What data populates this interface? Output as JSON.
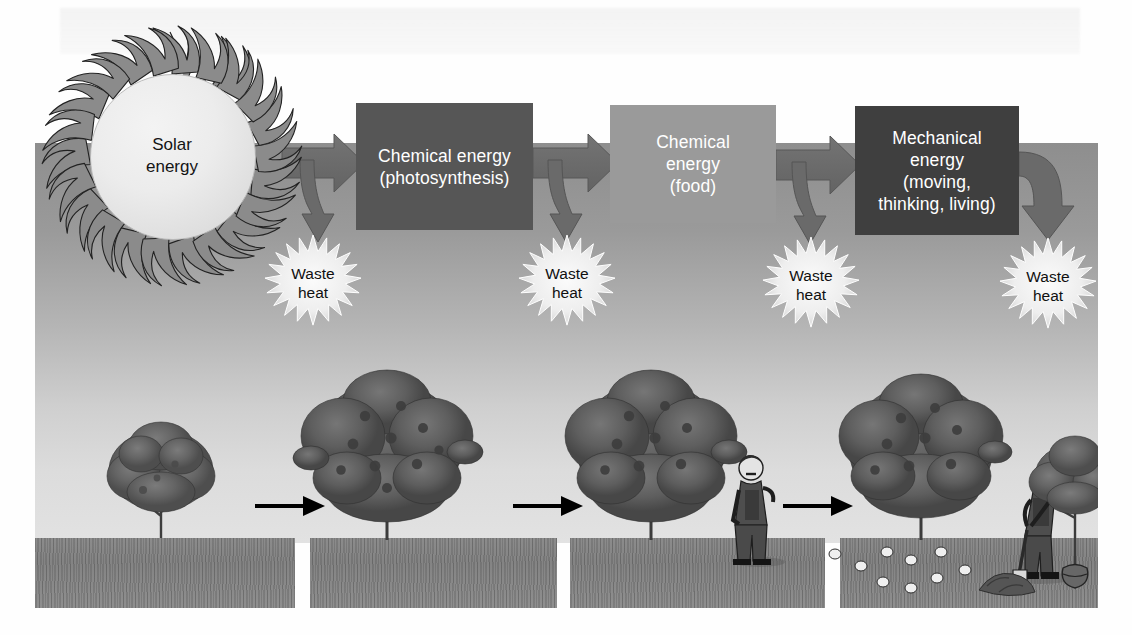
{
  "figure": {
    "title": "Energy flow from solar energy to mechanical energy with waste heat at each step",
    "type": "process-flow-diagram"
  },
  "sun": {
    "label_line1": "Solar",
    "label_line2": "energy",
    "icon": "sun-icon"
  },
  "energy_boxes": [
    {
      "id": "photosynthesis",
      "lines": [
        "Chemical energy",
        "(photosynthesis)"
      ],
      "color": "#565656",
      "text_color": "#ffffff"
    },
    {
      "id": "food",
      "lines": [
        "Chemical",
        "energy",
        "(food)"
      ],
      "color": "#9a9a9a",
      "text_color": "#ffffff"
    },
    {
      "id": "mechanical",
      "lines": [
        "Mechanical",
        "energy",
        "(moving,",
        "thinking, living)"
      ],
      "color": "#3f3f3f",
      "text_color": "#ffffff"
    }
  ],
  "waste_heat": [
    {
      "line1": "Waste",
      "line2": "heat"
    },
    {
      "line1": "Waste",
      "line2": "heat"
    },
    {
      "line1": "Waste",
      "line2": "heat"
    },
    {
      "line1": "Waste",
      "line2": "heat"
    }
  ],
  "scene_panels": [
    {
      "id": "panel-1",
      "contents": [
        "small-tree"
      ]
    },
    {
      "id": "panel-2",
      "contents": [
        "large-fruit-tree"
      ]
    },
    {
      "id": "panel-3",
      "contents": [
        "large-fruit-tree",
        "standing-man"
      ]
    },
    {
      "id": "panel-4",
      "contents": [
        "large-fruit-tree",
        "digging-man",
        "fallen-fruit",
        "sapling-with-rootball",
        "soil-mound"
      ]
    }
  ],
  "colors": {
    "sky_top": "#8e8e8e",
    "sky_bottom": "#e2e2e2",
    "ground": "#8a8a8a",
    "flow_arrow": "#6d6d6d",
    "flow_arrow_dark": "#5a5a5a",
    "burst": "#f2f2f2",
    "black_arrow": "#000000",
    "foliage": "#5f5f5f",
    "trunk": "#4a4a4a"
  }
}
